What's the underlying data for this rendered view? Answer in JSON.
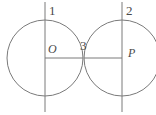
{
  "figure": {
    "type": "geometry-diagram",
    "width": 156,
    "height": 115,
    "background_color": "#ffffff",
    "stroke_color": "#7a7a7a",
    "label_color": "#4a4a4a",
    "labels": {
      "line_left": "1",
      "line_right": "2",
      "tangent_point": "3",
      "center_left": "O",
      "center_right": "P"
    },
    "circles": [
      {
        "name": "left-circle",
        "cx": 45,
        "cy": 58,
        "r": 38
      },
      {
        "name": "right-circle",
        "cx": 122,
        "cy": 58,
        "r": 38
      }
    ],
    "vertical_lines": [
      {
        "name": "left-vertical-line",
        "x": 45,
        "y1": 2,
        "y2": 112,
        "label": "1"
      },
      {
        "name": "right-vertical-line",
        "x": 122,
        "y1": 2,
        "y2": 112,
        "label": "2"
      }
    ],
    "horizontal_segments": [
      {
        "name": "left-radius-segment",
        "x1": 45,
        "x2": 83,
        "y": 58
      },
      {
        "name": "right-radius-segment",
        "x1": 84,
        "x2": 122,
        "y": 58
      }
    ],
    "points": [
      {
        "name": "center-left-point",
        "label": "O",
        "x": 45,
        "y": 58
      },
      {
        "name": "center-right-point",
        "label": "P",
        "x": 122,
        "y": 58
      },
      {
        "name": "tangency-point",
        "label": "3",
        "x": 83.5,
        "y": 58
      }
    ]
  }
}
